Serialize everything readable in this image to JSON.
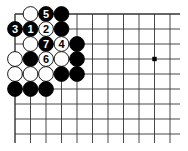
{
  "board": {
    "origin_x": 15,
    "origin_y": 14,
    "spacing_x": 15.5,
    "spacing_y": 15,
    "cols": 11,
    "rows": 9,
    "line_extend_right": 180,
    "line_extend_bottom": 143,
    "line_color": "#333333",
    "edge_top": true,
    "edge_left": true,
    "star_points": [
      {
        "col": 9,
        "row": 3
      }
    ]
  },
  "stones": [
    {
      "col": 1,
      "row": 0,
      "color": "white",
      "label": ""
    },
    {
      "col": 2,
      "row": 0,
      "color": "black",
      "label": "5"
    },
    {
      "col": 3,
      "row": 0,
      "color": "black",
      "label": ""
    },
    {
      "col": 0,
      "row": 1,
      "color": "black",
      "label": "3"
    },
    {
      "col": 1,
      "row": 1,
      "color": "black",
      "label": "1"
    },
    {
      "col": 2,
      "row": 1,
      "color": "white",
      "label": "2"
    },
    {
      "col": 3,
      "row": 1,
      "color": "black",
      "label": ""
    },
    {
      "col": 1,
      "row": 2,
      "color": "white",
      "label": ""
    },
    {
      "col": 2,
      "row": 2,
      "color": "black",
      "label": "7"
    },
    {
      "col": 3,
      "row": 2,
      "color": "white",
      "label": "4"
    },
    {
      "col": 4,
      "row": 2,
      "color": "black",
      "label": ""
    },
    {
      "col": 0,
      "row": 3,
      "color": "white",
      "label": ""
    },
    {
      "col": 1,
      "row": 3,
      "color": "black",
      "label": ""
    },
    {
      "col": 2,
      "row": 3,
      "color": "white",
      "label": "6"
    },
    {
      "col": 3,
      "row": 3,
      "color": "white",
      "label": ""
    },
    {
      "col": 4,
      "row": 3,
      "color": "black",
      "label": ""
    },
    {
      "col": 0,
      "row": 4,
      "color": "white",
      "label": ""
    },
    {
      "col": 1,
      "row": 4,
      "color": "white",
      "label": ""
    },
    {
      "col": 2,
      "row": 4,
      "color": "white",
      "label": ""
    },
    {
      "col": 3,
      "row": 4,
      "color": "black",
      "label": ""
    },
    {
      "col": 4,
      "row": 4,
      "color": "black",
      "label": ""
    },
    {
      "col": 0,
      "row": 5,
      "color": "black",
      "label": ""
    },
    {
      "col": 1,
      "row": 5,
      "color": "black",
      "label": ""
    },
    {
      "col": 2,
      "row": 5,
      "color": "black",
      "label": ""
    }
  ]
}
